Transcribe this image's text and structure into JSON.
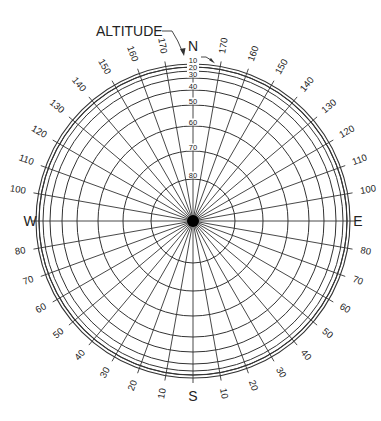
{
  "diagram": {
    "title_label": "ALTITUDE",
    "cardinals": {
      "north": "N",
      "east": "E",
      "south": "S",
      "west": "W"
    },
    "center": {
      "x": 193,
      "y": 221
    },
    "outer_rings": [
      157,
      154
    ],
    "altitude_rings": [
      {
        "value": "10",
        "r": 154
      },
      {
        "value": "20",
        "r": 150
      },
      {
        "value": "30",
        "r": 143
      },
      {
        "value": "40",
        "r": 131
      },
      {
        "value": "50",
        "r": 116
      },
      {
        "value": "60",
        "r": 95
      },
      {
        "value": "70",
        "r": 70
      },
      {
        "value": "80",
        "r": 42
      }
    ],
    "azimuth_step_deg": 10,
    "azimuth_labels_right": [
      "170",
      "160",
      "150",
      "140",
      "130",
      "120",
      "110",
      "100",
      "E",
      "80",
      "70",
      "60",
      "50",
      "40",
      "30",
      "20",
      "10"
    ],
    "azimuth_labels_left": [
      "170",
      "160",
      "150",
      "140",
      "130",
      "120",
      "110",
      "100",
      "W",
      "80",
      "70",
      "60",
      "50",
      "40",
      "30",
      "20",
      "10"
    ],
    "colors": {
      "line": "#333333",
      "text": "#222222",
      "background": "#ffffff",
      "center_dot": "#000000"
    }
  }
}
